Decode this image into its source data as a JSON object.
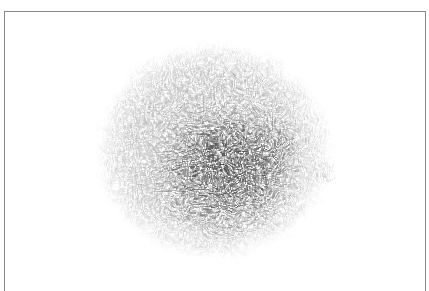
{
  "image": {
    "subject": "fur-ball",
    "description": "Grayscale furry/hairy textured round blob centered on a white canvas within a thin gray frame",
    "colors": {
      "background": "#ffffff",
      "frame_border": "#8a8a8a",
      "fur_light": "#c8c8c8",
      "fur_mid": "#8f8f8f",
      "fur_dark": "#4a4a4a"
    },
    "blob": {
      "center_x": 215,
      "center_y": 152,
      "radius_x": 118,
      "radius_y": 110
    }
  }
}
